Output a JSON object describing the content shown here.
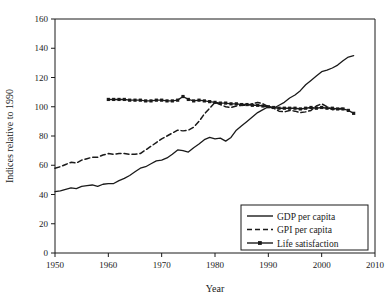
{
  "chart_data": {
    "type": "line",
    "title": "",
    "xlabel": "Year",
    "ylabel": "Indices relative to 1990",
    "xlim": [
      1950,
      2010
    ],
    "ylim": [
      0,
      160
    ],
    "xticks": [
      1950,
      1960,
      1970,
      1980,
      1990,
      2000,
      2010
    ],
    "xtick_labels": [
      "1950",
      "1960",
      "1970",
      "1980",
      "1990",
      "2000",
      "2010"
    ],
    "yticks": [
      0,
      20,
      40,
      60,
      80,
      100,
      120,
      140,
      160
    ],
    "ytick_labels": [
      "0",
      "20",
      "40",
      "60",
      "80",
      "100",
      "120",
      "140",
      "160"
    ],
    "grid": false,
    "legend_position": "lower right",
    "series": [
      {
        "name": "GDP per capita",
        "style": "solid",
        "marker": "none",
        "color": "#1a1a1a",
        "x": [
          1950,
          1951,
          1952,
          1953,
          1954,
          1955,
          1956,
          1957,
          1958,
          1959,
          1960,
          1961,
          1962,
          1963,
          1964,
          1965,
          1966,
          1967,
          1968,
          1969,
          1970,
          1971,
          1972,
          1973,
          1974,
          1975,
          1976,
          1977,
          1978,
          1979,
          1980,
          1981,
          1982,
          1983,
          1984,
          1985,
          1986,
          1987,
          1988,
          1989,
          1990,
          1991,
          1992,
          1993,
          1994,
          1995,
          1996,
          1997,
          1998,
          1999,
          2000,
          2001,
          2002,
          2003,
          2004,
          2005,
          2006
        ],
        "values": [
          42,
          42.5,
          43.5,
          44.5,
          44,
          45.5,
          46,
          46.5,
          45.5,
          47,
          47.5,
          47.5,
          49.5,
          51,
          53,
          55.5,
          58,
          59,
          61,
          63,
          63.5,
          65,
          67.5,
          70.5,
          70,
          69,
          72,
          74.5,
          77.5,
          79,
          78,
          78.5,
          76.5,
          79,
          84,
          87,
          90,
          93,
          96,
          98,
          100,
          99,
          101,
          103,
          106,
          108,
          111,
          115,
          118,
          121,
          124,
          125,
          126.5,
          128.5,
          131.5,
          134,
          135
        ]
      },
      {
        "name": "GPI per capita",
        "style": "dashed",
        "marker": "none",
        "color": "#1a1a1a",
        "x": [
          1950,
          1951,
          1952,
          1953,
          1954,
          1955,
          1956,
          1957,
          1958,
          1959,
          1960,
          1961,
          1962,
          1963,
          1964,
          1965,
          1966,
          1967,
          1968,
          1969,
          1970,
          1971,
          1972,
          1973,
          1974,
          1975,
          1976,
          1977,
          1978,
          1979,
          1980,
          1981,
          1982,
          1983,
          1984,
          1985,
          1986,
          1987,
          1988,
          1989,
          1990,
          1991,
          1992,
          1993,
          1994,
          1995,
          1996,
          1997,
          1998,
          1999,
          2000,
          2001,
          2002,
          2003,
          2004
        ],
        "values": [
          58,
          59,
          60.5,
          62,
          61.5,
          63.5,
          64.5,
          65.5,
          65.5,
          67,
          68,
          67.5,
          68,
          68,
          67.5,
          67.5,
          68,
          70.5,
          73,
          75.5,
          78,
          80,
          82,
          84,
          83.5,
          84,
          86,
          90,
          95,
          99,
          103,
          101.5,
          100,
          99.5,
          100.5,
          101,
          101,
          102,
          103,
          102,
          100,
          99,
          97,
          96.5,
          97.5,
          97,
          96,
          96.5,
          97.5,
          100.5,
          102,
          100,
          98,
          98.5,
          99
        ]
      },
      {
        "name": "Life satisfaction",
        "style": "solid-marker",
        "marker": "square",
        "color": "#1a1a1a",
        "x": [
          1960,
          1961,
          1962,
          1963,
          1964,
          1965,
          1966,
          1967,
          1968,
          1969,
          1970,
          1971,
          1972,
          1973,
          1974,
          1975,
          1976,
          1977,
          1978,
          1979,
          1980,
          1981,
          1982,
          1983,
          1984,
          1985,
          1986,
          1987,
          1988,
          1989,
          1990,
          1991,
          1992,
          1993,
          1994,
          1995,
          1996,
          1997,
          1998,
          1999,
          2000,
          2001,
          2002,
          2003,
          2004,
          2005,
          2006
        ],
        "values": [
          105,
          105,
          105,
          105,
          104.5,
          104.5,
          104.5,
          104,
          104,
          104.5,
          104.5,
          104,
          104,
          104.5,
          107,
          105,
          104,
          104.5,
          104,
          103.5,
          103,
          102.5,
          102.5,
          102,
          102,
          101.5,
          101.5,
          101,
          101,
          100.5,
          100,
          99.5,
          99,
          99,
          99,
          99,
          98.5,
          99,
          99.5,
          99,
          99.5,
          99,
          99,
          98.5,
          98.5,
          97.5,
          95.5
        ]
      }
    ]
  },
  "legend": {
    "items": [
      {
        "label": "GDP per capita"
      },
      {
        "label": "GPI per capita"
      },
      {
        "label": "Life satisfaction"
      }
    ]
  }
}
